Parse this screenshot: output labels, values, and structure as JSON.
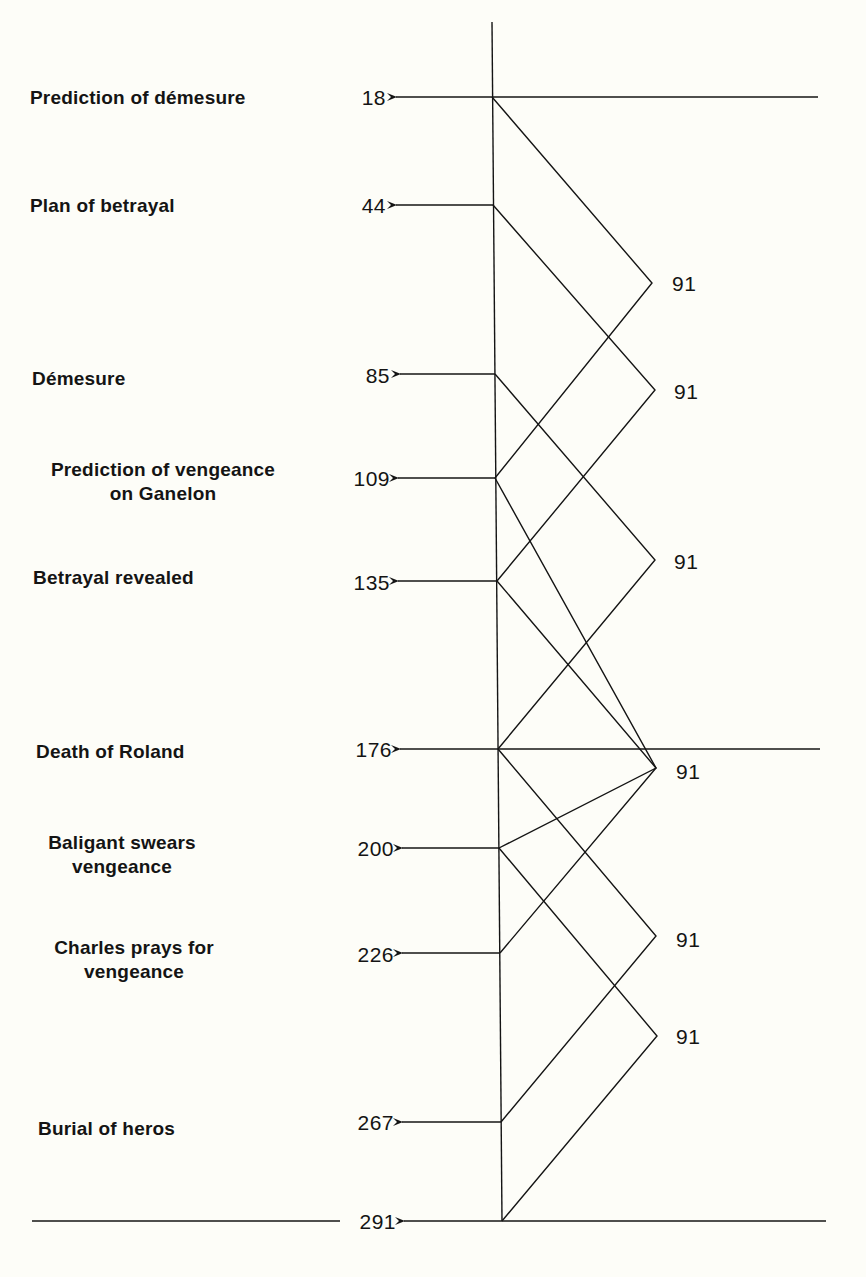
{
  "diagram": {
    "type": "structural-symmetry-diagram",
    "events": [
      {
        "label": "Prediction of démesure",
        "line": "18"
      },
      {
        "label": "Plan of betrayal",
        "line": "44"
      },
      {
        "label": "Démesure",
        "line": "85"
      },
      {
        "label": "Prediction of vengeance\non Ganelon",
        "line": "109"
      },
      {
        "label": "Betrayal revealed",
        "line": "135"
      },
      {
        "label": "Death of Roland",
        "line": "176"
      },
      {
        "label": "Baligant swears\nvengeance",
        "line": "200"
      },
      {
        "label": "Charles prays for\nvengeance",
        "line": "226"
      },
      {
        "label": "Burial of heros",
        "line": "267"
      },
      {
        "label": "",
        "line": "291"
      }
    ],
    "connections": [
      {
        "from": "18",
        "to": "109",
        "span": "91"
      },
      {
        "from": "44",
        "to": "135",
        "span": "91"
      },
      {
        "from": "85",
        "to": "176",
        "span": "91"
      },
      {
        "from": "109",
        "to": "200",
        "span": "91"
      },
      {
        "from": "135",
        "to": "226",
        "span": "91"
      },
      {
        "from": "176",
        "to": "267",
        "span": "91"
      },
      {
        "from": "200",
        "to": "291",
        "span": "91"
      }
    ],
    "divider_lines_at": [
      "18",
      "176",
      "291"
    ]
  },
  "labels": {
    "e0": "Prediction of démesure",
    "e1": "Plan of betrayal",
    "e2": "Démesure",
    "e3": "Prediction of vengeance\non Ganelon",
    "e4": "Betrayal revealed",
    "e5": "Death of Roland",
    "e6": "Baligant swears\nvengeance",
    "e7": "Charles prays for\nvengeance",
    "e8": "Burial of heros",
    "n0": "18",
    "n1": "44",
    "n2": "85",
    "n3": "109",
    "n4": "135",
    "n5": "176",
    "n6": "200",
    "n7": "226",
    "n8": "267",
    "n9": "291",
    "s0": "91",
    "s1": "91",
    "s2": "91",
    "s3": "91",
    "s4": "91",
    "s5": "91",
    "s6": "91"
  },
  "colors": {
    "background": "#fdfdf8",
    "ink": "#141414"
  }
}
